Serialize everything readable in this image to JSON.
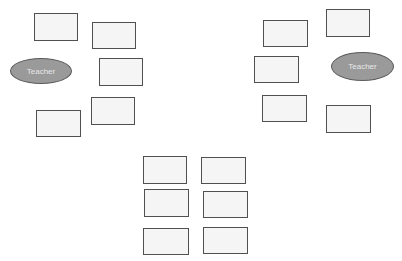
{
  "diagram": {
    "colors": {
      "desk_fill": "#f5f5f5",
      "desk_border": "#505050",
      "teacher_fill": "#9a9a9a",
      "teacher_border": "#5a5a5a",
      "teacher_text": "#e8e8e8"
    },
    "teachers": [
      {
        "label": "Teacher",
        "x": 10,
        "y": 58,
        "w": 62,
        "h": 26
      },
      {
        "label": "Teacher",
        "x": 331,
        "y": 52,
        "w": 63,
        "h": 29
      }
    ],
    "desks": {
      "left_group": [
        {
          "x": 34,
          "y": 13,
          "w": 44,
          "h": 28
        },
        {
          "x": 92,
          "y": 22,
          "w": 44,
          "h": 27
        },
        {
          "x": 99,
          "y": 58,
          "w": 44,
          "h": 28
        },
        {
          "x": 91,
          "y": 97,
          "w": 44,
          "h": 28
        },
        {
          "x": 36,
          "y": 110,
          "w": 45,
          "h": 27
        }
      ],
      "right_group": [
        {
          "x": 263,
          "y": 20,
          "w": 45,
          "h": 27
        },
        {
          "x": 326,
          "y": 9,
          "w": 44,
          "h": 28
        },
        {
          "x": 254,
          "y": 56,
          "w": 45,
          "h": 27
        },
        {
          "x": 262,
          "y": 95,
          "w": 45,
          "h": 27
        },
        {
          "x": 326,
          "y": 105,
          "w": 45,
          "h": 28
        }
      ],
      "center_group": [
        {
          "x": 143,
          "y": 156,
          "w": 44,
          "h": 28
        },
        {
          "x": 201,
          "y": 157,
          "w": 45,
          "h": 27
        },
        {
          "x": 144,
          "y": 189,
          "w": 45,
          "h": 28
        },
        {
          "x": 203,
          "y": 191,
          "w": 45,
          "h": 27
        },
        {
          "x": 143,
          "y": 228,
          "w": 46,
          "h": 27
        },
        {
          "x": 203,
          "y": 227,
          "w": 45,
          "h": 27
        }
      ]
    }
  }
}
